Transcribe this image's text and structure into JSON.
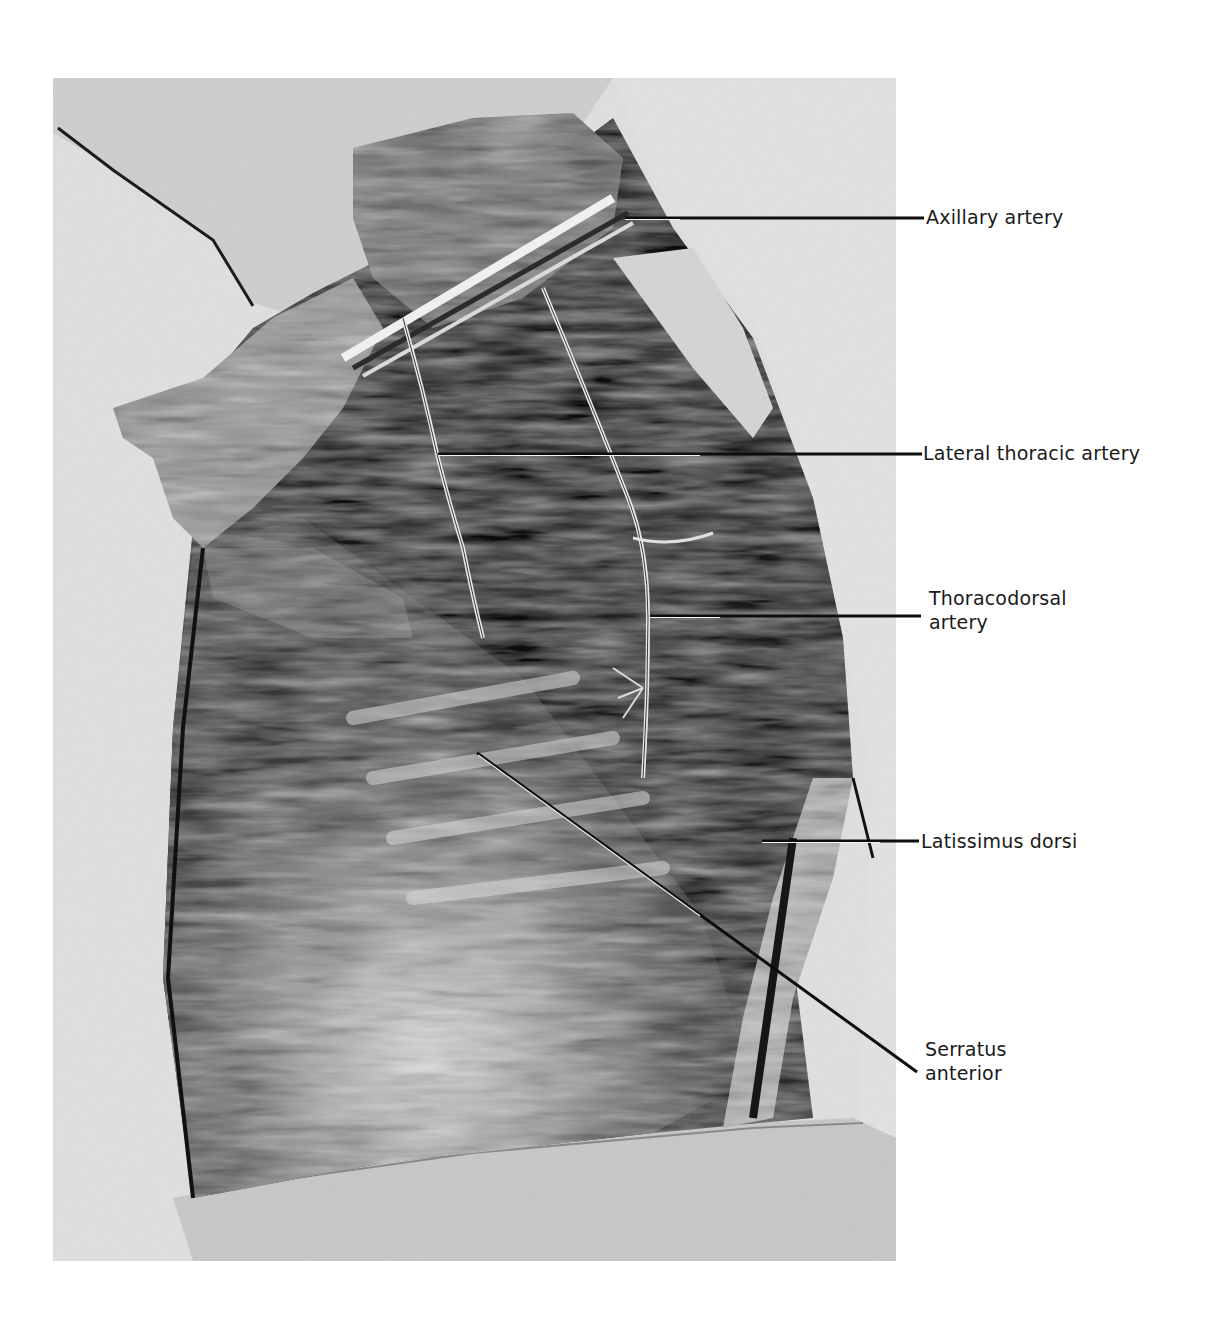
{
  "figure": {
    "type": "anatomical-photograph",
    "colors": {
      "background": "#ffffff",
      "label_text": "#1a1a1a",
      "leader_line": "#0d0d0d"
    },
    "labels": [
      {
        "id": "axillary-artery",
        "text": "Axillary artery",
        "line1": "Axillary artery",
        "line2": "",
        "x": 925,
        "y": 205,
        "leader": {
          "x1": 625,
          "y1": 218,
          "x2": 924,
          "y2": 218
        }
      },
      {
        "id": "lateral-thoracic-artery",
        "text": "Lateral thoracic artery",
        "line1": "Lateral thoracic artery",
        "line2": "",
        "x": 923,
        "y": 441,
        "leader": {
          "x1": 438,
          "y1": 454,
          "x2": 922,
          "y2": 454
        }
      },
      {
        "id": "thoracodorsal-artery",
        "text": "Thoracodorsal artery",
        "line1": "Thoracodorsal",
        "line2": "artery",
        "x": 928,
        "y": 586,
        "leader": {
          "x1": 650,
          "y1": 616,
          "x2": 921,
          "y2": 616
        }
      },
      {
        "id": "latissimus-dorsi",
        "text": "Latissimus dorsi",
        "line1": "Latissimus dorsi",
        "line2": "",
        "x": 921,
        "y": 829,
        "leader": {
          "x1": 762,
          "y1": 841,
          "x2": 919,
          "y2": 841
        }
      },
      {
        "id": "serratus-anterior",
        "text": "Serratus anterior",
        "line1": "Serratus",
        "line2": "anterior",
        "x": 925,
        "y": 1038,
        "leader": {
          "x1": 477,
          "y1": 753,
          "x2": 917,
          "y2": 1072
        }
      }
    ]
  }
}
